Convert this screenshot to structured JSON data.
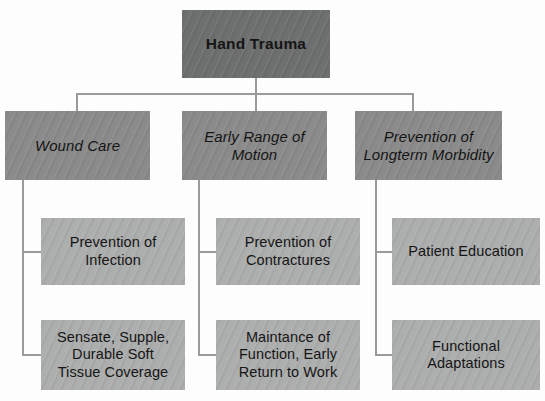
{
  "diagram": {
    "title": "Hand Trauma",
    "root": {
      "label": "Hand Trauma"
    },
    "branches": [
      {
        "label": "Wound Care",
        "children": [
          {
            "label": "Prevention of\nInfection"
          },
          {
            "label": "Sensate, Supple,\nDurable Soft\nTissue Coverage"
          }
        ]
      },
      {
        "label": "Early Range of\nMotion",
        "children": [
          {
            "label": "Prevention of\nContractures"
          },
          {
            "label": "Maintance of\nFunction, Early\nReturn to Work"
          }
        ]
      },
      {
        "label": "Prevention of\nLongterm Morbidity",
        "children": [
          {
            "label": "Patient Education"
          },
          {
            "label": "Functional\nAdaptations"
          }
        ]
      }
    ],
    "colors": {
      "root_box": "#6e6f6f",
      "level_two_box": "#8b8b8b",
      "level_three_box": "#adaeae",
      "connector_line": "#9a9a9a",
      "text": "#151515",
      "background": "#fdfdfd"
    }
  }
}
